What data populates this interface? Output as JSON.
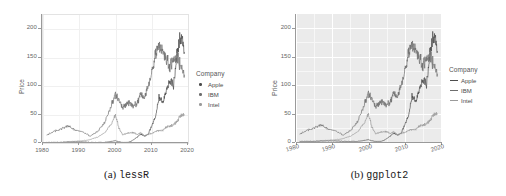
{
  "figure": {
    "panels": [
      {
        "id": "lessR",
        "caption_prefix": "(a)",
        "caption_name": "lessR",
        "legend": {
          "title": "Company",
          "key_style": "point"
        }
      },
      {
        "id": "ggplot2",
        "caption_prefix": "(b)",
        "caption_name": "ggplot2",
        "legend": {
          "title": "Company",
          "key_style": "line"
        }
      }
    ]
  },
  "chart_data": [
    {
      "type": "line",
      "title": "",
      "subtitle": "",
      "xlabel": "",
      "ylabel": "Price",
      "xlim": [
        1980,
        2020
      ],
      "ylim": [
        0,
        225
      ],
      "xticks": [
        1980,
        1990,
        2000,
        2010,
        2020
      ],
      "yticks": [
        0,
        50,
        100,
        150,
        200
      ],
      "grid": true,
      "legend_position": "right",
      "legend_title": "Company",
      "theme": "lessR",
      "series": [
        {
          "name": "Apple",
          "color": "#4d4d4d",
          "x": [
            1981,
            1983,
            1985,
            1987,
            1989,
            1991,
            1993,
            1995,
            1997,
            1999,
            2000,
            2001,
            2002,
            2003,
            2004,
            2005,
            2006,
            2007,
            2008,
            2009,
            2010,
            2011,
            2012,
            2013,
            2014,
            2015,
            2016,
            2017,
            2018,
            2019
          ],
          "y": [
            1,
            1,
            1,
            2,
            2,
            2,
            1,
            1,
            1,
            3,
            4,
            2,
            1,
            1,
            2,
            6,
            10,
            16,
            12,
            15,
            30,
            45,
            80,
            70,
            90,
            110,
            100,
            160,
            190,
            160
          ]
        },
        {
          "name": "IBM",
          "color": "#6e6e6e",
          "x": [
            1981,
            1983,
            1985,
            1987,
            1989,
            1991,
            1993,
            1995,
            1997,
            1999,
            2000,
            2001,
            2002,
            2003,
            2004,
            2005,
            2006,
            2007,
            2008,
            2009,
            2010,
            2011,
            2012,
            2013,
            2014,
            2015,
            2016,
            2017,
            2018,
            2019
          ],
          "y": [
            14,
            20,
            25,
            30,
            22,
            20,
            12,
            20,
            35,
            70,
            85,
            75,
            60,
            70,
            70,
            65,
            70,
            85,
            80,
            100,
            125,
            155,
            170,
            165,
            150,
            135,
            145,
            150,
            135,
            120
          ]
        },
        {
          "name": "Intel",
          "color": "#9b9b9b",
          "x": [
            1981,
            1983,
            1985,
            1987,
            1989,
            1991,
            1993,
            1995,
            1997,
            1999,
            2000,
            2001,
            2002,
            2003,
            2004,
            2005,
            2006,
            2007,
            2008,
            2009,
            2010,
            2011,
            2012,
            2013,
            2014,
            2015,
            2016,
            2017,
            2018,
            2019
          ],
          "y": [
            0.5,
            1,
            1,
            2,
            3,
            4,
            6,
            10,
            18,
            35,
            50,
            25,
            14,
            17,
            18,
            18,
            15,
            18,
            12,
            15,
            17,
            20,
            22,
            22,
            28,
            30,
            32,
            38,
            48,
            50
          ]
        }
      ]
    },
    {
      "type": "line",
      "title": "",
      "subtitle": "",
      "xlabel": "",
      "ylabel": "Price",
      "xlim": [
        1980,
        2020
      ],
      "ylim": [
        0,
        225
      ],
      "xticks": [
        1980,
        1990,
        2000,
        2010,
        2020
      ],
      "yticks": [
        0,
        50,
        100,
        150,
        200
      ],
      "grid": true,
      "legend_position": "right",
      "legend_title": "Company",
      "theme": "ggplot2",
      "series": [
        {
          "name": "Apple",
          "color": "#4d4d4d",
          "x": [
            1981,
            1983,
            1985,
            1987,
            1989,
            1991,
            1993,
            1995,
            1997,
            1999,
            2000,
            2001,
            2002,
            2003,
            2004,
            2005,
            2006,
            2007,
            2008,
            2009,
            2010,
            2011,
            2012,
            2013,
            2014,
            2015,
            2016,
            2017,
            2018,
            2019
          ],
          "y": [
            1,
            1,
            1,
            2,
            2,
            2,
            1,
            1,
            1,
            3,
            4,
            2,
            1,
            1,
            2,
            6,
            10,
            16,
            12,
            15,
            30,
            45,
            80,
            70,
            90,
            110,
            100,
            160,
            190,
            160
          ]
        },
        {
          "name": "IBM",
          "color": "#6e6e6e",
          "x": [
            1981,
            1983,
            1985,
            1987,
            1989,
            1991,
            1993,
            1995,
            1997,
            1999,
            2000,
            2001,
            2002,
            2003,
            2004,
            2005,
            2006,
            2007,
            2008,
            2009,
            2010,
            2011,
            2012,
            2013,
            2014,
            2015,
            2016,
            2017,
            2018,
            2019
          ],
          "y": [
            14,
            20,
            25,
            30,
            22,
            20,
            12,
            20,
            35,
            70,
            85,
            75,
            60,
            70,
            70,
            65,
            70,
            85,
            80,
            100,
            125,
            155,
            170,
            165,
            150,
            135,
            145,
            150,
            135,
            120
          ]
        },
        {
          "name": "Intel",
          "color": "#9b9b9b",
          "x": [
            1981,
            1983,
            1985,
            1987,
            1989,
            1991,
            1993,
            1995,
            1997,
            1999,
            2000,
            2001,
            2002,
            2003,
            2004,
            2005,
            2006,
            2007,
            2008,
            2009,
            2010,
            2011,
            2012,
            2013,
            2014,
            2015,
            2016,
            2017,
            2018,
            2019
          ],
          "y": [
            0.5,
            1,
            1,
            2,
            3,
            4,
            6,
            10,
            18,
            35,
            50,
            25,
            14,
            17,
            18,
            18,
            15,
            18,
            12,
            15,
            17,
            20,
            22,
            22,
            28,
            30,
            32,
            38,
            48,
            50
          ]
        }
      ]
    }
  ]
}
